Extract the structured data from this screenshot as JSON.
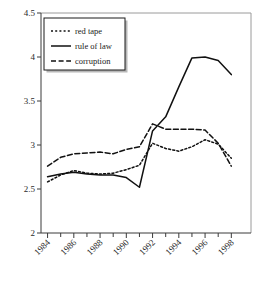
{
  "chart_data": {
    "type": "line",
    "title": "",
    "subtitle": "",
    "xlabel": "",
    "ylabel": "",
    "x": [
      1984,
      1985,
      1986,
      1987,
      1988,
      1989,
      1990,
      1991,
      1992,
      1993,
      1994,
      1995,
      1996,
      1997,
      1998
    ],
    "xlim": [
      1983.5,
      1999.5
    ],
    "ylim": [
      2,
      4.5
    ],
    "x_tick_labels": [
      "1984",
      "1986",
      "1988",
      "1990",
      "1992",
      "1994",
      "1996",
      "1998"
    ],
    "x_tick_values": [
      1984,
      1986,
      1988,
      1990,
      1992,
      1994,
      1996,
      1998
    ],
    "x_minor_ticks": [
      1985,
      1987,
      1989,
      1991,
      1993,
      1995,
      1997
    ],
    "y_tick_labels": [
      "2",
      "2.5",
      "3",
      "3.5",
      "4",
      "4.5"
    ],
    "y_tick_values": [
      2,
      2.5,
      3,
      3.5,
      4,
      4.5
    ],
    "grid": false,
    "legend_position": "top-left",
    "series": [
      {
        "name": "red tape",
        "style": "dotted",
        "values": [
          2.58,
          2.66,
          2.71,
          2.68,
          2.67,
          2.68,
          2.72,
          2.77,
          3.02,
          2.96,
          2.93,
          2.98,
          3.06,
          3.01,
          2.85
        ]
      },
      {
        "name": "rule of law",
        "style": "solid",
        "values": [
          2.64,
          2.67,
          2.69,
          2.67,
          2.66,
          2.66,
          2.63,
          2.52,
          3.16,
          3.32,
          3.66,
          3.99,
          4.0,
          3.96,
          3.8
        ]
      },
      {
        "name": "corruption",
        "style": "dashed",
        "values": [
          2.76,
          2.86,
          2.9,
          2.91,
          2.92,
          2.9,
          2.95,
          2.98,
          3.24,
          3.18,
          3.18,
          3.18,
          3.17,
          3.02,
          2.76
        ]
      }
    ]
  },
  "legend": {
    "entries": [
      {
        "label": "red tape"
      },
      {
        "label": "rule of law"
      },
      {
        "label": "corruption"
      }
    ]
  }
}
